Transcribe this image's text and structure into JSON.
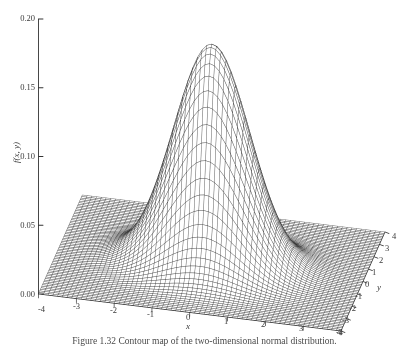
{
  "figure": {
    "kind": "surface-plot",
    "background_color": "#ffffff",
    "line_color": "#222222"
  },
  "caption": {
    "text": "Figure 1.32 Contour map of the two-dimensional normal distribution."
  },
  "chart_data": {
    "type": "surface",
    "title": "",
    "xlabel": "x",
    "ylabel": "y",
    "zlabel": "f(x, y)",
    "xlim": [
      -4,
      4
    ],
    "ylim": [
      -4,
      4
    ],
    "zlim": [
      0.0,
      0.2
    ],
    "grid": false,
    "legend": "none",
    "x_ticks": [
      -4,
      -3,
      -2,
      -1,
      0,
      1,
      2,
      3,
      4
    ],
    "x_tick_labels": [
      "-4",
      "-3",
      "-2",
      "-1",
      "0",
      "1",
      "2",
      "3",
      "4"
    ],
    "y_ticks": [
      -4,
      -3,
      -2,
      -1,
      0,
      1,
      2,
      3,
      4
    ],
    "y_tick_labels": [
      "-4",
      "-3",
      "-2",
      "-1",
      "0",
      "1",
      "2",
      "3",
      "4"
    ],
    "z_ticks": [
      0.0,
      0.05,
      0.1,
      0.15,
      0.2
    ],
    "z_tick_labels": [
      "0.00",
      "0.05",
      "0.10",
      "0.15",
      "0.20"
    ],
    "surface": {
      "description": "bivariate normal probability density surface rendered as a fine wireframe mesh",
      "peak_value": 0.177,
      "peak_x": 0.0,
      "peak_y": 0.0,
      "mesh_n": 64,
      "mean": [
        0.0,
        0.0
      ],
      "sigma_x": 1.0,
      "sigma_y": 1.0,
      "rho": 0.0
    },
    "view": {
      "azimuth_deg": -52,
      "elevation_deg": 22
    }
  },
  "axes": {
    "z": {
      "name": "z-axis",
      "title": "f(x, y)",
      "ticks": [
        {
          "label": "0.20",
          "top": 14
        },
        {
          "label": "0.15",
          "top": 83
        },
        {
          "label": "0.10",
          "top": 152
        },
        {
          "label": "0.05",
          "top": 221
        },
        {
          "label": "0.00",
          "top": 290
        }
      ]
    },
    "x": {
      "name": "x-axis",
      "title": "x",
      "ticks": [
        {
          "label": "-4",
          "left": 38,
          "top": 305
        },
        {
          "label": "-3",
          "left": 73,
          "top": 302
        },
        {
          "label": "-2",
          "left": 110,
          "top": 306
        },
        {
          "label": "-1",
          "left": 147,
          "top": 310
        },
        {
          "label": "0",
          "left": 186,
          "top": 313
        },
        {
          "label": "1",
          "left": 224,
          "top": 317
        },
        {
          "label": "2",
          "left": 261,
          "top": 320
        },
        {
          "label": "3",
          "left": 299,
          "top": 324
        },
        {
          "label": "4",
          "left": 337,
          "top": 328
        }
      ]
    },
    "y": {
      "name": "y-axis",
      "title": "y",
      "ticks": [
        {
          "label": "4",
          "left": 392,
          "top": 232
        },
        {
          "label": "3",
          "left": 385,
          "top": 244
        },
        {
          "label": "2",
          "left": 379,
          "top": 256
        },
        {
          "label": "1",
          "left": 372,
          "top": 268
        },
        {
          "label": "0",
          "left": 365,
          "top": 280
        },
        {
          "label": "-1",
          "left": 355,
          "top": 292
        },
        {
          "label": "-2",
          "left": 349,
          "top": 304
        },
        {
          "label": "-3",
          "left": 342,
          "top": 316
        },
        {
          "label": "-4",
          "left": 336,
          "top": 328
        }
      ]
    }
  }
}
